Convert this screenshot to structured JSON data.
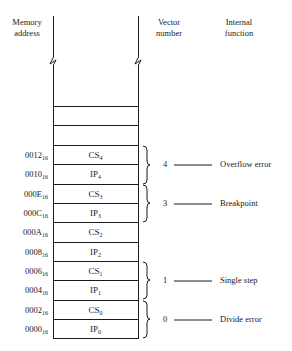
{
  "headers": {
    "memory_address": [
      "Memory",
      "address"
    ],
    "vector_number": [
      "Vector",
      "number"
    ],
    "internal_function": [
      "Internal",
      "function"
    ]
  },
  "rows": [
    {
      "addr": "0012",
      "base": "16",
      "reg": "CS",
      "idx": "4"
    },
    {
      "addr": "0010",
      "base": "16",
      "reg": "IP",
      "idx": "4"
    },
    {
      "addr": "000E",
      "base": "16",
      "reg": "CS",
      "idx": "3"
    },
    {
      "addr": "000C",
      "base": "16",
      "reg": "IP",
      "idx": "3"
    },
    {
      "addr": "000A",
      "base": "16",
      "reg": "CS",
      "idx": "2"
    },
    {
      "addr": "0008",
      "base": "16",
      "reg": "IP",
      "idx": "2"
    },
    {
      "addr": "0006",
      "base": "16",
      "reg": "CS",
      "idx": "1"
    },
    {
      "addr": "0004",
      "base": "16",
      "reg": "IP",
      "idx": "1"
    },
    {
      "addr": "0002",
      "base": "16",
      "reg": "CS",
      "idx": "0"
    },
    {
      "addr": "0000",
      "base": "16",
      "reg": "IP",
      "idx": "0"
    }
  ],
  "vectors": [
    {
      "number": "4",
      "function": "Overflow error"
    },
    {
      "number": "3",
      "function": "Breakpoint"
    },
    {
      "number": "1",
      "function": "Single step"
    },
    {
      "number": "0",
      "function": "Divide error"
    }
  ]
}
